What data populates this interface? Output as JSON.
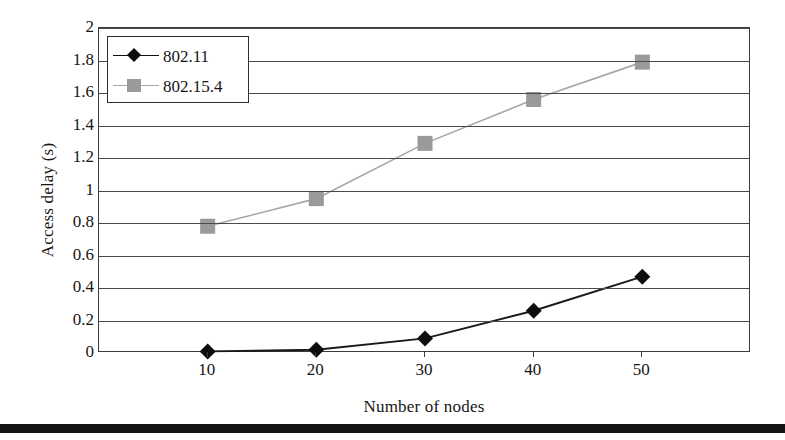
{
  "chart_data": {
    "type": "line",
    "title": "",
    "xlabel": "Number of nodes",
    "ylabel": "Access delay (s)",
    "x": [
      10,
      20,
      30,
      40,
      50
    ],
    "xtick_labels": [
      "10",
      "20",
      "30",
      "40",
      "50"
    ],
    "ytick_labels": [
      "0",
      "0.2",
      "0.4",
      "0.6",
      "0.8",
      "1",
      "1.2",
      "1.4",
      "1.6",
      "1.8",
      "2"
    ],
    "ylim": [
      0,
      2
    ],
    "xlim": [
      0,
      60
    ],
    "ytick_step": 0.2,
    "grid": "horizontal",
    "legend_position": "top-left-inside",
    "series": [
      {
        "name": "802.11",
        "marker": "diamond",
        "color": "#0d0d0d",
        "line_color": "#1a1a1a",
        "values": [
          0.01,
          0.02,
          0.09,
          0.26,
          0.47
        ]
      },
      {
        "name": "802.15.4",
        "marker": "square",
        "color": "#9a9a9a",
        "line_color": "#a6a6a6",
        "values": [
          0.78,
          0.95,
          1.29,
          1.56,
          1.79
        ]
      }
    ]
  },
  "legend": {
    "items": [
      {
        "label": "802.11",
        "marker": "diamond-marker",
        "key_class": "dark"
      },
      {
        "label": "802.15.4",
        "marker": "square-marker",
        "key_class": "light"
      }
    ]
  },
  "axes": {
    "y_title": "Access delay (s)",
    "x_title": "Number of nodes"
  }
}
